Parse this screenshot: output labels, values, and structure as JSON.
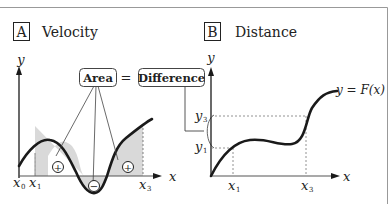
{
  "panel_a": {
    "badge": "A",
    "title": "Velocity",
    "y_label": "y",
    "x_label": "x",
    "ticks": {
      "x0": "x",
      "x0_sub": "0",
      "x1": "x",
      "x1_sub": "1",
      "x3": "x",
      "x3_sub": "3"
    },
    "area_label": "Area",
    "equals": "=",
    "difference_label": "Difference",
    "plus": "+",
    "minus": "−"
  },
  "panel_b": {
    "badge": "B",
    "title": "Distance",
    "y_label": "y",
    "x_label": "x",
    "curve_label": "y = F(x)",
    "ticks": {
      "x1": "x",
      "x1_sub": "1",
      "x3": "x",
      "x3_sub": "3",
      "y1": "y",
      "y1_sub": "1",
      "y3": "y",
      "y3_sub": "3"
    }
  },
  "colors": {
    "stroke": "#1a1a1a",
    "fill": "#d9d9d9",
    "frame": "#888888"
  }
}
